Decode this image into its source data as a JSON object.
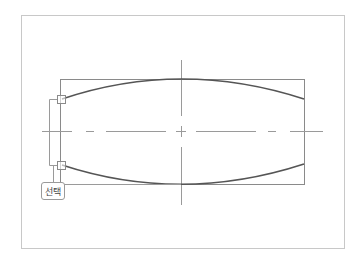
{
  "diagram": {
    "type": "technical-drawing",
    "colors": {
      "frame": "#c8c8c8",
      "geometry": "#8a8a8a",
      "curve": "#555555",
      "centerline": "#9a9a9a"
    },
    "callout": {
      "label": "선택"
    }
  }
}
